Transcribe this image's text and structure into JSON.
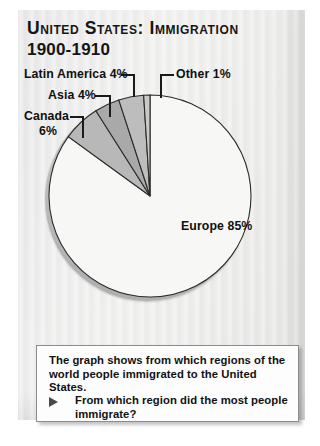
{
  "page": {
    "title_line1": "United States: Immigration",
    "title_line2": "1900-1910"
  },
  "chart_data": {
    "type": "pie",
    "title": "United States: Immigration 1900-1910",
    "categories": [
      "Europe",
      "Canada",
      "Asia",
      "Latin America",
      "Other"
    ],
    "values": [
      85,
      6,
      4,
      4,
      1
    ],
    "unit": "%",
    "labels": [
      "Europe  85%",
      "Canada 6%",
      "Asia  4%",
      "Latin America  4%",
      "Other 1%"
    ],
    "slice_colors": [
      "#f7f7f5",
      "#b8b8b8",
      "#a9a9a9",
      "#bdbdbd",
      "#c9c9c9"
    ],
    "outline_color": "#2b2b2b",
    "legend": "none",
    "grid": false,
    "start_angle_deg": -90,
    "direction": "counterclockwise",
    "annotations": [
      "Latin America  4%",
      "Asia  4%",
      "Canada",
      "6%",
      "Other 1%",
      "Europe  85%"
    ]
  },
  "labels": {
    "latin_america": "Latin America  4%",
    "asia": "Asia  4%",
    "canada": "Canada",
    "canada_pct": "6%",
    "other": "Other 1%",
    "europe": "Europe  85%"
  },
  "caption": {
    "statement": "The graph shows from which regions of the world people immigrated to the United States.",
    "question": "From which region did the most people immigrate?",
    "bullet_icon": "triangle-right-icon"
  },
  "colors": {
    "panel_background": "#eeeeee",
    "page_background": "#ffffff",
    "text": "#121212",
    "europe_slice": "#f7f7f5",
    "small_slice": "#b5b5b5",
    "outline": "#2b2b2b",
    "caption_background": "#fdfdfd",
    "caption_border": "#8c8c8c"
  }
}
